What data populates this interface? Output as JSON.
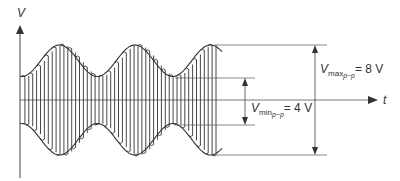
{
  "diagram": {
    "type": "amplitude-modulated waveform",
    "axes": {
      "y_label": "V",
      "x_label": "t"
    },
    "annotations": {
      "vmax": {
        "symbol": "V",
        "sub": "max",
        "subsub": "p−p",
        "value": "= 8 V"
      },
      "vmin": {
        "symbol": "V",
        "sub": "min",
        "subsub": "p−p",
        "value": "= 4 V"
      }
    },
    "stroke_color": "#333333"
  }
}
